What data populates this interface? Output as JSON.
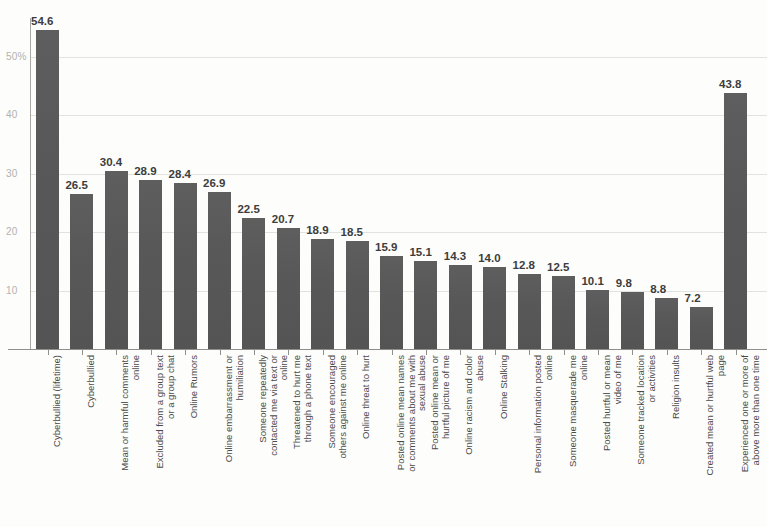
{
  "chart_data": {
    "type": "bar",
    "title": "",
    "subtitle": "",
    "xlabel": "",
    "ylabel": "",
    "ylim": [
      0,
      55
    ],
    "grid": true,
    "legend": false,
    "orientation": "vertical",
    "bar_color": "#585858",
    "y_ticks": [
      {
        "value": 50,
        "label": "50%"
      },
      {
        "value": 40,
        "label": "40"
      },
      {
        "value": 30,
        "label": "30"
      },
      {
        "value": 20,
        "label": "20"
      },
      {
        "value": 10,
        "label": "10"
      }
    ],
    "categories": [
      "Cyberbullied (lifetime)",
      "Cyberbullied",
      "Mean or harmful comments online",
      "Excluded from a group text or a group chat",
      "Online Rumors",
      "Online embarrassment or humiliation",
      "Someone repeatedly contacted me via text or online",
      "Threatened to hurt me through a phone text",
      "Someone encouraged others against me online",
      "Online threat to hurt",
      "Posted online mean names or comments about me with sexual abuse",
      "Posted online mean or hurtful picture of me",
      "Online racism and color abuse",
      "Online Stalking",
      "Personal information posted online",
      "Someone masquerade me online",
      "Posted hurtful or mean video of me",
      "Someone tracked location or activities",
      "Religion insults",
      "Created mean or hurtful web page",
      "Experienced one or more of above more than one time"
    ],
    "category_lines": [
      [
        "Cyberbullied (lifetime)"
      ],
      [
        "Cyberbullied"
      ],
      [
        "Mean or harmful comments",
        "online"
      ],
      [
        "Excluded from a group text",
        "or a group chat"
      ],
      [
        "Online Rumors"
      ],
      [
        "Online embarrassment or",
        "humiliation"
      ],
      [
        "Someone repeatedly",
        "contacted me via text or",
        "online"
      ],
      [
        "Threatened to hurt me",
        "through a phone text"
      ],
      [
        "Someone encouraged",
        "others against me online"
      ],
      [
        "Online threat to hurt"
      ],
      [
        "Posted online mean names",
        "or comments about me with",
        "sexual abuse"
      ],
      [
        "Posted online mean or",
        "hurtful picture of me"
      ],
      [
        "Online racism and color",
        "abuse"
      ],
      [
        "Online Stalking"
      ],
      [
        "Personal information posted",
        "online"
      ],
      [
        "Someone masquerade me",
        "online"
      ],
      [
        "Posted hurtful or mean",
        "video of me"
      ],
      [
        "Someone tracked location",
        "or activities"
      ],
      [
        "Religion insults"
      ],
      [
        "Created mean or hurtful web",
        "page"
      ],
      [
        "Experienced one or more of",
        "above more than one time"
      ]
    ],
    "values": [
      54.6,
      26.5,
      30.4,
      28.9,
      28.4,
      26.9,
      22.5,
      20.7,
      18.9,
      18.5,
      15.9,
      15.1,
      14.3,
      14.0,
      12.8,
      12.5,
      10.1,
      9.8,
      8.8,
      7.2,
      43.8
    ],
    "value_labels": [
      "54.6",
      "26.5",
      "30.4",
      "28.9",
      "28.4",
      "26.9",
      "22.5",
      "20.7",
      "18.9",
      "18.5",
      "15.9",
      "15.1",
      "14.3",
      "14.0",
      "12.8",
      "12.5",
      "10.1",
      "9.8",
      "8.8",
      "7.2",
      "43.8"
    ]
  }
}
